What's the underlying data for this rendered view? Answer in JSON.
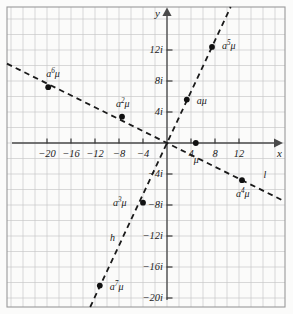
{
  "figure": {
    "kind": "cartesian-plot",
    "background_color": "#fbfbfa",
    "grid_color": "#c9c9c9",
    "axis_color": "#4a4a4a",
    "ink_color": "#1a1a1a",
    "frame": {
      "x": 7,
      "y": 7,
      "width": 278,
      "height": 300
    }
  },
  "chart_data": {
    "type": "scatter",
    "title": "",
    "xlabel": "x",
    "ylabel": "y",
    "grid": true,
    "legend": "none",
    "xlim": [
      -22.5,
      19.5
    ],
    "ylim": [
      -22.5,
      21.5
    ],
    "x_ticks": [
      -20,
      -16,
      -12,
      -8,
      -4,
      4,
      8,
      12
    ],
    "x_tick_labels": [
      "−20",
      "−16",
      "−12",
      "−8",
      "−4",
      "4",
      "8",
      "12"
    ],
    "y_ticks": [
      12,
      8,
      4,
      -4,
      -8,
      -12,
      -16,
      -20
    ],
    "y_tick_labels": [
      "12i",
      "8i",
      "4i",
      "−4i",
      "−8i",
      "−12i",
      "−16i",
      "−20i"
    ],
    "grid_step_x": 2,
    "grid_step_y": 2,
    "series": [
      {
        "name": "points",
        "marker": "filled-circle",
        "points": [
          {
            "label": "a⁵μ",
            "base": "a",
            "exponent": "5",
            "suffix": "μ",
            "x": 7.5,
            "y": 12.4,
            "label_dx": 10,
            "label_dy": -1
          },
          {
            "label": "aμ",
            "base": "a",
            "exponent": "",
            "suffix": "μ",
            "x": 3.3,
            "y": 5.6,
            "label_dx": 10,
            "label_dy": 2
          },
          {
            "label": "μ",
            "base": "",
            "exponent": "",
            "suffix": "μ",
            "x": 4.8,
            "y": 0.0,
            "label_dx": -2,
            "label_dy": 18
          },
          {
            "label": "a²μ",
            "base": "a",
            "exponent": "2",
            "suffix": "μ",
            "x": -7.5,
            "y": 3.4,
            "label_dx": -6,
            "label_dy": -13
          },
          {
            "label": "a⁶μ",
            "base": "a",
            "exponent": "6",
            "suffix": "μ",
            "x": -19.8,
            "y": 7.2,
            "label_dx": -2,
            "label_dy": -13
          },
          {
            "label": "a³μ",
            "base": "a",
            "exponent": "3",
            "suffix": "μ",
            "x": -4.0,
            "y": -7.7,
            "label_dx": -30,
            "label_dy": 0
          },
          {
            "label": "a⁴μ",
            "base": "a",
            "exponent": "4",
            "suffix": "μ",
            "x": 12.5,
            "y": -4.8,
            "label_dx": -6,
            "label_dy": 14
          },
          {
            "label": "a⁷μ",
            "base": "a",
            "exponent": "7",
            "suffix": "μ",
            "x": -11.2,
            "y": -18.4,
            "label_dx": 10,
            "label_dy": 1
          }
        ]
      }
    ],
    "lines": [
      {
        "name": "h",
        "style": "dashed",
        "label": "h",
        "label_x": -9.5,
        "label_y": -12.4,
        "description": "steep positive-slope line through the origin"
      },
      {
        "name": "l",
        "style": "dashed",
        "label": "l",
        "label_x": 16.1,
        "label_y": -4.3,
        "description": "shallow negative-slope line through the origin"
      }
    ]
  },
  "axes": {
    "x_axis_label": "x",
    "y_axis_label": "y"
  }
}
